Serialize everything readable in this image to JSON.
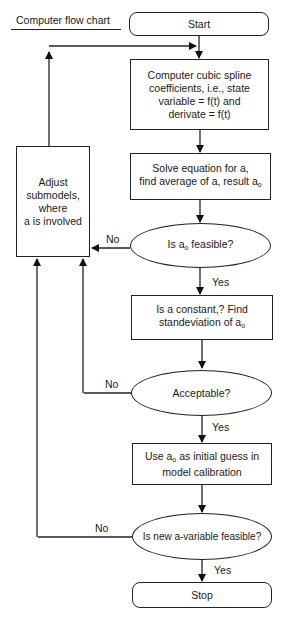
{
  "title": "Computer flow chart",
  "nodes": {
    "start": "Start",
    "spline": [
      "Computer cubic spline",
      "coefficients, i.e., state",
      "variable = f(t) and",
      "derivate = f(t)"
    ],
    "solve": {
      "line1": "Solve equation for a,",
      "line2_prefix": "find average of a, result a",
      "line2_sub": "o"
    },
    "feasible": {
      "prefix": "Is a",
      "sub": "o",
      "suffix": " feasible?"
    },
    "constant": {
      "line1": "Is a constant,? Find",
      "line2_prefix": "standeviation of a",
      "line2_sub": "o"
    },
    "acceptable": "Acceptable?",
    "initial_guess": {
      "line1_prefix": "Use a",
      "line1_sub": "o",
      "line1_suffix": " as initial guess in",
      "line2": "model calibration"
    },
    "new_feasible": "Is new a-variable feasible?",
    "stop": "Stop",
    "adjust": [
      "Adjust",
      "submodels,",
      "where",
      "a is involved"
    ]
  },
  "edge_labels": {
    "no1": "No",
    "yes1": "Yes",
    "no2": "No",
    "yes2": "Yes",
    "no3": "No",
    "yes3": "Yes"
  }
}
